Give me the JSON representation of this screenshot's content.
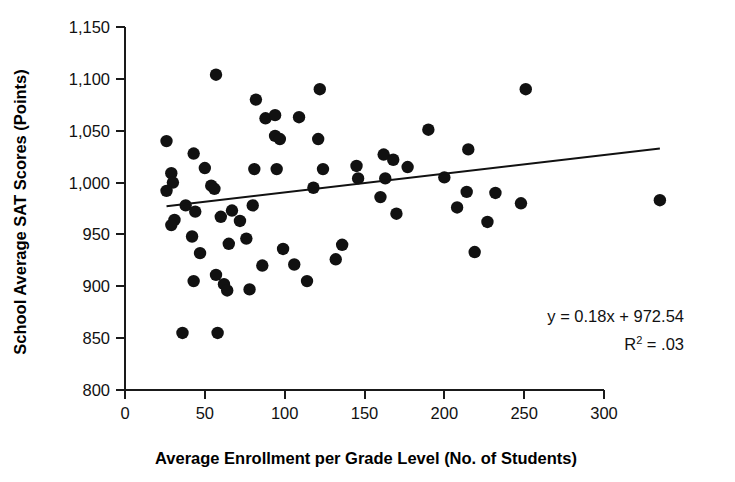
{
  "chart_data": {
    "type": "scatter",
    "title": "",
    "xlabel": "Average Enrollment per Grade Level (No. of Students)",
    "ylabel": "School Average SAT Scores (Points)",
    "xlim": [
      0,
      300
    ],
    "ylim": [
      800,
      1150
    ],
    "xticks": [
      0,
      50,
      100,
      150,
      200,
      250,
      300
    ],
    "yticks": [
      800,
      850,
      900,
      950,
      1000,
      1050,
      1100,
      1150
    ],
    "xtick_labels": [
      "0",
      "50",
      "100",
      "150",
      "200",
      "250",
      "300"
    ],
    "ytick_labels": [
      "800",
      "850",
      "900",
      "950",
      "1,000",
      "1,050",
      "1,100",
      "1,150"
    ],
    "grid": false,
    "legend": null,
    "marker": "filled-circle",
    "marker_color": "#111111",
    "series": [
      {
        "name": "Schools",
        "points": [
          [
            26,
            1040
          ],
          [
            43,
            1028
          ],
          [
            50,
            1014
          ],
          [
            29,
            1009
          ],
          [
            30,
            1000
          ],
          [
            54,
            997
          ],
          [
            56,
            994
          ],
          [
            57,
            1104
          ],
          [
            82,
            1080
          ],
          [
            88,
            1062
          ],
          [
            94,
            1065
          ],
          [
            109,
            1063
          ],
          [
            122,
            1090
          ],
          [
            94,
            1045
          ],
          [
            97,
            1042
          ],
          [
            121,
            1042
          ],
          [
            81,
            1013
          ],
          [
            95,
            1013
          ],
          [
            124,
            1013
          ],
          [
            145,
            1016
          ],
          [
            118,
            995
          ],
          [
            80,
            978
          ],
          [
            67,
            973
          ],
          [
            26,
            992
          ],
          [
            38,
            978
          ],
          [
            44,
            972
          ],
          [
            31,
            964
          ],
          [
            60,
            967
          ],
          [
            72,
            963
          ],
          [
            29,
            959
          ],
          [
            42,
            948
          ],
          [
            65,
            941
          ],
          [
            76,
            946
          ],
          [
            47,
            932
          ],
          [
            43,
            905
          ],
          [
            57,
            911
          ],
          [
            62,
            902
          ],
          [
            36,
            855
          ],
          [
            58,
            855
          ],
          [
            162,
            1027
          ],
          [
            168,
            1022
          ],
          [
            177,
            1015
          ],
          [
            146,
            1004
          ],
          [
            163,
            1004
          ],
          [
            215,
            1032
          ],
          [
            160,
            986
          ],
          [
            232,
            990
          ],
          [
            248,
            980
          ],
          [
            170,
            970
          ],
          [
            227,
            962
          ],
          [
            251,
            1090
          ],
          [
            190,
            1051
          ],
          [
            200,
            1005
          ],
          [
            208,
            976
          ],
          [
            214,
            991
          ],
          [
            219,
            933
          ],
          [
            335,
            983
          ],
          [
            99,
            936
          ],
          [
            106,
            921
          ],
          [
            114,
            905
          ],
          [
            132,
            926
          ],
          [
            136,
            940
          ],
          [
            86,
            920
          ],
          [
            78,
            897
          ],
          [
            64,
            896
          ]
        ]
      }
    ],
    "trendline": {
      "equation": "y = 0.18x + 972.54",
      "r_squared_label": "R",
      "r_squared_exp": "2",
      "r_squared_value": " = .03",
      "slope": 0.18,
      "intercept": 972.54,
      "x_start": 26,
      "x_end": 335
    }
  }
}
